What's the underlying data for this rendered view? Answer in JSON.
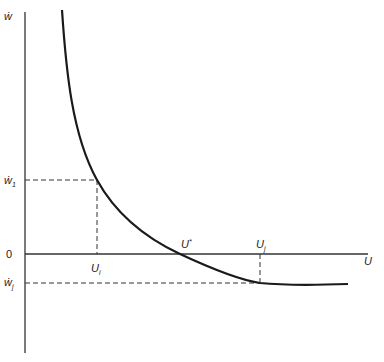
{
  "diagram": {
    "y_axis_label": "ẇ",
    "x_axis_label": "U",
    "origin_label": "0",
    "y_ticks": [
      {
        "base": "ẇ",
        "sub": "1"
      },
      {
        "base": "ẇ",
        "sub": "j"
      }
    ],
    "x_ticks": [
      {
        "base": "U",
        "sub": "i"
      },
      {
        "base": "U",
        "sup": "*"
      },
      {
        "base": "U",
        "sub": "j"
      }
    ],
    "colors": {
      "curve": "#1a1a1a",
      "axis": "#333333",
      "dashed": "#333333",
      "background": "#ffffff"
    }
  }
}
